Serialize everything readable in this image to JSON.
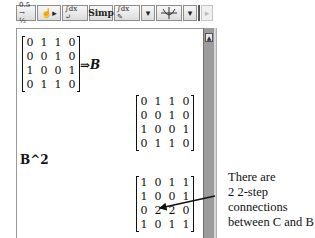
{
  "toolbar": {
    "buttons": [
      {
        "name": "numeric-fraction-button",
        "label": "0.5 → ½",
        "icon": "decimal-to-fraction-icon"
      },
      {
        "name": "evaluate-button",
        "label": "☝▸",
        "icon": "hand-pointer-icon"
      },
      {
        "name": "integral-toggle-button",
        "label": "∫dx ↵",
        "icon": "integral-enter-icon"
      },
      {
        "name": "simp-button",
        "label": "Simp",
        "icon": ""
      },
      {
        "name": "integral-edit-button",
        "label": "∫dx ✎",
        "icon": "integral-pencil-icon"
      },
      {
        "name": "dropdown-1-button",
        "label": "▾",
        "icon": "chevron-down-icon"
      },
      {
        "name": "graph-button",
        "label": "⊕",
        "icon": "graph-axes-icon"
      },
      {
        "name": "dropdown-2-button",
        "label": "▾",
        "icon": "chevron-down-icon"
      },
      {
        "name": "play-button",
        "label": "▸",
        "icon": "play-icon",
        "disabled": true
      }
    ]
  },
  "notebook": {
    "input_matrix": [
      [
        "0",
        "1",
        "1",
        "0"
      ],
      [
        "0",
        "0",
        "1",
        "0"
      ],
      [
        "1",
        "0",
        "0",
        "1"
      ],
      [
        "0",
        "1",
        "1",
        "0"
      ]
    ],
    "assign_label": "⇒B",
    "output_matrix_1": [
      [
        "0",
        "1",
        "1",
        "0"
      ],
      [
        "0",
        "0",
        "1",
        "0"
      ],
      [
        "1",
        "0",
        "0",
        "1"
      ],
      [
        "0",
        "1",
        "1",
        "0"
      ]
    ],
    "command": "B^2",
    "output_matrix_2": [
      [
        "1",
        "0",
        "1",
        "1"
      ],
      [
        "1",
        "0",
        "0",
        "1"
      ],
      [
        "0",
        "2",
        "2",
        "0"
      ],
      [
        "1",
        "0",
        "1",
        "1"
      ]
    ]
  },
  "annotation": {
    "lines": [
      "There are",
      "2 2-step",
      "connections",
      "between C and B"
    ]
  },
  "scrollbar": {
    "up_arrow": "▲"
  }
}
